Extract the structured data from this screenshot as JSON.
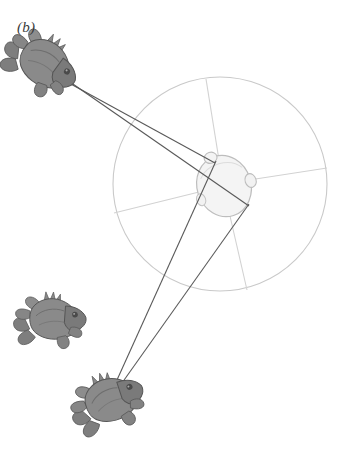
{
  "figure": {
    "panel_label": "(b)",
    "type": "schematic-diagram",
    "caption_text": "",
    "background_color": "#ffffff"
  },
  "colors": {
    "frog_body": "#8a8a8a",
    "frog_body_dark": "#6f6f6f",
    "frog_outline": "#5a5a5a",
    "head_fill": "#f2f2f2",
    "head_outline": "#b9b9b9",
    "sight_line": "#555555",
    "circle_stroke": "#c9c9c9",
    "spoke_stroke": "#d2d2d2",
    "label_color": "#3a3a3a"
  },
  "elements": {
    "orientation_circle": {
      "name": "orientation-circle",
      "center_x": 220,
      "center_y": 184,
      "radius": 107,
      "stroke_width": 1
    },
    "head": {
      "name": "receiver-head",
      "center_x": 224,
      "center_y": 186,
      "rx": 26,
      "ry": 31,
      "rotation_deg": -18,
      "eye_bump_x": 216,
      "eye_bump_y": 156,
      "ear_bump_x": 250,
      "ear_bump_y": 183
    },
    "spokes": [
      {
        "name": "spoke-up",
        "x2": 206,
        "y2": 79
      },
      {
        "name": "spoke-right",
        "x2": 327,
        "y2": 168
      },
      {
        "name": "spoke-down-right",
        "x2": 247,
        "y2": 290
      },
      {
        "name": "spoke-left",
        "x2": 114,
        "y2": 213
      }
    ],
    "frogs": [
      {
        "name": "frog-upper-left",
        "label": "calling male upper-left",
        "x": 45,
        "y": 62,
        "scale": 1.0,
        "rotation_deg": 28,
        "connected": true
      },
      {
        "name": "frog-lower-left",
        "label": "calling male lower-left",
        "x": 50,
        "y": 320,
        "scale": 0.92,
        "rotation_deg": -8,
        "connected": false
      },
      {
        "name": "frog-bottom",
        "label": "calling male bottom",
        "x": 112,
        "y": 398,
        "scale": 1.0,
        "rotation_deg": 14,
        "connected": true
      }
    ],
    "sight_lines": [
      {
        "name": "sight-line-upper-a",
        "x1": 57,
        "y1": 73,
        "x2": 247,
        "y2": 205
      },
      {
        "name": "sight-line-upper-b",
        "x1": 58,
        "y1": 76,
        "x2": 214,
        "y2": 164
      },
      {
        "name": "sight-line-bottom-a",
        "x1": 112,
        "y1": 392,
        "x2": 216,
        "y2": 162
      },
      {
        "name": "sight-line-bottom-b",
        "x1": 116,
        "y1": 391,
        "x2": 248,
        "y2": 203
      }
    ]
  }
}
